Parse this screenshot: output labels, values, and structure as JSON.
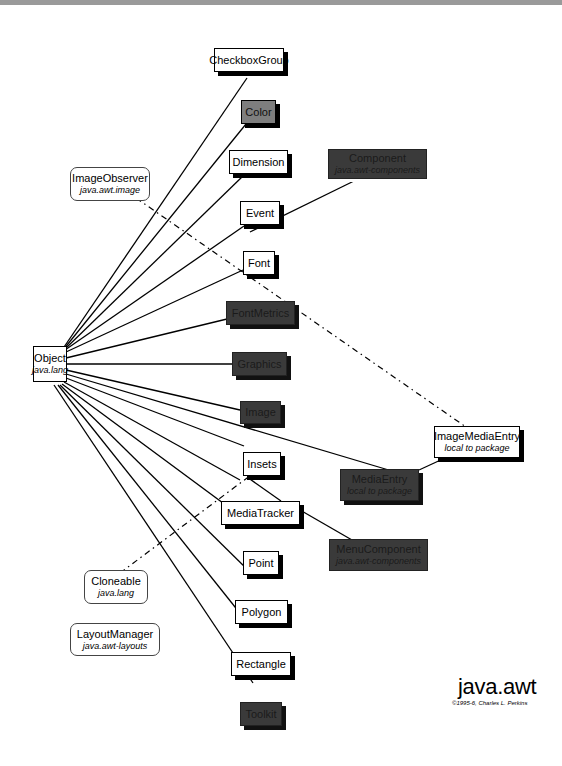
{
  "diagram": {
    "title": "java.awt",
    "copyright": "©1995-6, Charles L. Perkins",
    "root": {
      "name": "Object",
      "package": "java.lang"
    },
    "interfaces": [
      {
        "name": "ImageObserver",
        "package": "java.awt.image"
      },
      {
        "name": "Cloneable",
        "package": "java.lang"
      },
      {
        "name": "LayoutManager",
        "package": "java.awt-layouts"
      }
    ],
    "classes": [
      {
        "name": "CheckboxGroup",
        "style": "concrete"
      },
      {
        "name": "Color",
        "style": "final"
      },
      {
        "name": "Dimension",
        "style": "concrete"
      },
      {
        "name": "Event",
        "style": "concrete"
      },
      {
        "name": "Font",
        "style": "concrete"
      },
      {
        "name": "FontMetrics",
        "style": "abstract"
      },
      {
        "name": "Graphics",
        "style": "abstract"
      },
      {
        "name": "Image",
        "style": "abstract"
      },
      {
        "name": "Insets",
        "style": "concrete"
      },
      {
        "name": "MediaTracker",
        "style": "concrete"
      },
      {
        "name": "Point",
        "style": "concrete"
      },
      {
        "name": "Polygon",
        "style": "concrete"
      },
      {
        "name": "Rectangle",
        "style": "concrete"
      },
      {
        "name": "Toolkit",
        "style": "abstract"
      },
      {
        "name": "Component",
        "package": "java.awt-components",
        "style": "abstract"
      },
      {
        "name": "MediaEntry",
        "package": "local to package",
        "style": "abstract"
      },
      {
        "name": "MenuComponent",
        "package": "java.awt-components",
        "style": "abstract"
      },
      {
        "name": "ImageMediaEntry",
        "package": "local to package",
        "style": "concrete"
      }
    ],
    "colors": {
      "abstract": "#3a3a3a",
      "final": "#7e7e7e",
      "concrete": "#ffffff",
      "line": "#000000"
    }
  }
}
